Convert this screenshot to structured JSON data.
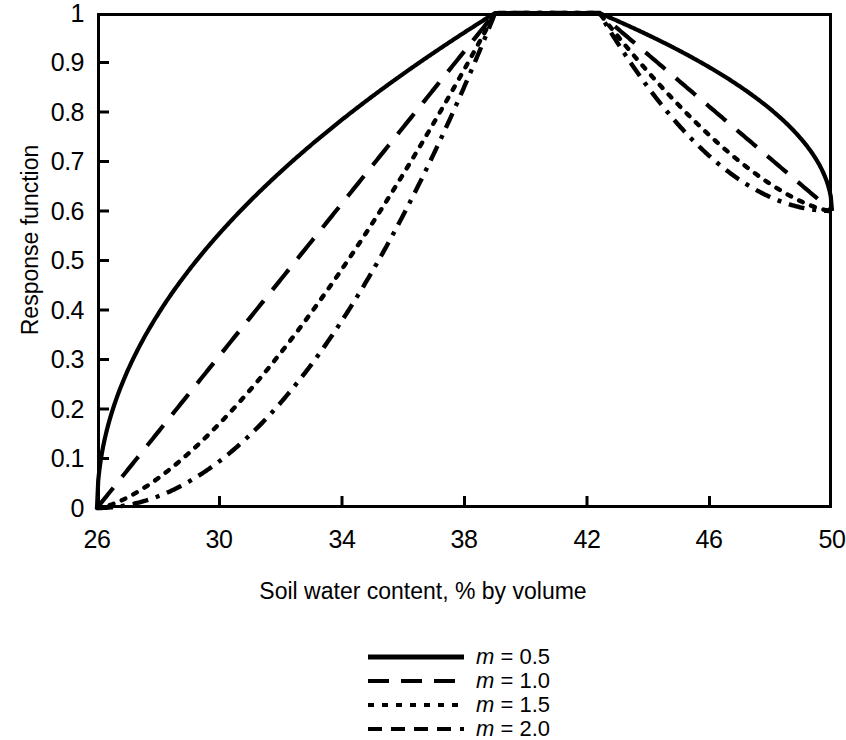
{
  "chart_data": {
    "type": "line",
    "title": "",
    "xlabel": "Soil water content, % by volume",
    "ylabel": "Response function",
    "xlim": [
      26,
      50
    ],
    "ylim": [
      0,
      1
    ],
    "xticks": [
      26,
      30,
      34,
      38,
      42,
      46,
      50
    ],
    "xtick_labels": [
      "26",
      "30",
      "34",
      "38",
      "42",
      "46",
      "50"
    ],
    "yticks": [
      0,
      0.1,
      0.2,
      0.3,
      0.4,
      0.5,
      0.6,
      0.7,
      0.8,
      0.9,
      1
    ],
    "ytick_labels": [
      "0",
      "0.1",
      "0.2",
      "0.3",
      "0.4",
      "0.5",
      "0.6",
      "0.7",
      "0.8",
      "0.9",
      "1"
    ],
    "grid": false,
    "legend_position": "below-center",
    "breakpoints": {
      "wilting_point": 26,
      "optimum_lower": 39,
      "optimum_upper": 42.4,
      "saturation": 50,
      "response_at_saturation": 0.6
    },
    "series": [
      {
        "name": "m = 0.5",
        "m": 0.5,
        "style": "solid",
        "color": "#000000",
        "x": [
          26,
          27,
          28,
          29,
          30,
          31,
          32,
          33,
          34,
          35,
          36,
          37,
          38,
          39,
          40,
          41,
          42.4,
          43,
          44,
          45,
          46,
          47,
          48,
          49,
          50
        ],
        "y": [
          0,
          0.277,
          0.392,
          0.48,
          0.555,
          0.62,
          0.679,
          0.734,
          0.784,
          0.832,
          0.877,
          0.919,
          0.961,
          1,
          1,
          1,
          1,
          0.973,
          0.925,
          0.874,
          0.819,
          0.761,
          0.697,
          0.625,
          0.6
        ]
      },
      {
        "name": "m = 1.0",
        "m": 1.0,
        "style": "long-dash",
        "color": "#000000",
        "x": [
          26,
          27,
          28,
          29,
          30,
          31,
          32,
          33,
          34,
          35,
          36,
          37,
          38,
          39,
          40,
          41,
          42.4,
          43,
          44,
          45,
          46,
          47,
          48,
          49,
          50
        ],
        "y": [
          0,
          0.077,
          0.154,
          0.231,
          0.308,
          0.385,
          0.462,
          0.538,
          0.615,
          0.692,
          0.769,
          0.846,
          0.923,
          1,
          1,
          1,
          1,
          0.947,
          0.855,
          0.763,
          0.671,
          0.579,
          0.487,
          0.395,
          0.6
        ]
      },
      {
        "name": "m = 1.5",
        "m": 1.5,
        "style": "dotted",
        "color": "#000000",
        "x": [
          26,
          27,
          28,
          29,
          30,
          31,
          32,
          33,
          34,
          35,
          36,
          37,
          38,
          39,
          40,
          41,
          42.4,
          43,
          44,
          45,
          46,
          47,
          48,
          49,
          50
        ],
        "y": [
          0,
          0.021,
          0.06,
          0.111,
          0.171,
          0.239,
          0.314,
          0.395,
          0.483,
          0.576,
          0.674,
          0.778,
          0.887,
          1,
          1,
          1,
          1,
          0.921,
          0.79,
          0.666,
          0.55,
          0.44,
          0.34,
          0.248,
          0.6
        ]
      },
      {
        "name": "m = 2.0",
        "m": 2.0,
        "style": "dash-dot",
        "color": "#000000",
        "x": [
          26,
          27,
          28,
          29,
          30,
          31,
          32,
          33,
          34,
          35,
          36,
          37,
          38,
          39,
          40,
          41,
          42.4,
          43,
          44,
          45,
          46,
          47,
          48,
          49,
          50
        ],
        "y": [
          0,
          0.006,
          0.024,
          0.053,
          0.095,
          0.148,
          0.213,
          0.29,
          0.379,
          0.479,
          0.592,
          0.716,
          0.852,
          1,
          1,
          1,
          1,
          0.896,
          0.731,
          0.582,
          0.45,
          0.335,
          0.237,
          0.156,
          0.6
        ]
      }
    ]
  },
  "axes": {
    "ylabel": "Response function",
    "xlabel": "Soil water content, % by volume",
    "ytick_labels": [
      "1",
      "0.9",
      "0.8",
      "0.7",
      "0.6",
      "0.5",
      "0.4",
      "0.3",
      "0.2",
      "0.1",
      "0"
    ],
    "xtick_labels": [
      "26",
      "30",
      "34",
      "38",
      "42",
      "46",
      "50"
    ]
  },
  "legend": {
    "items": [
      {
        "label": "m = 0.5",
        "symbol": "m",
        "equals": " = ",
        "value": "0.5",
        "style": "solid"
      },
      {
        "label": "m = 1.0",
        "symbol": "m",
        "equals": " = ",
        "value": "1.0",
        "style": "long-dash"
      },
      {
        "label": "m = 1.5",
        "symbol": "m",
        "equals": " = ",
        "value": "1.5",
        "style": "dotted"
      },
      {
        "label": "m = 2.0",
        "symbol": "m",
        "equals": " = ",
        "value": "2.0",
        "style": "dash-dot"
      }
    ]
  },
  "colors": {
    "line": "#000000",
    "frame": "#000000",
    "background": "#ffffff"
  }
}
